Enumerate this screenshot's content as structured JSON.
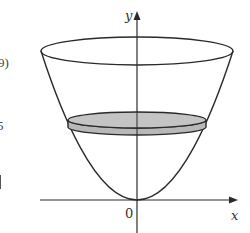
{
  "figure": {
    "axes": {
      "y_label": "y",
      "x_label": "x",
      "origin_label": "0"
    },
    "colors": {
      "stroke": "#2a2a2a",
      "disk_fill": "#b8b8b8",
      "background": "#ffffff"
    }
  },
  "left_margin_fragments": {
    "top": "9)",
    "middle": "5"
  }
}
